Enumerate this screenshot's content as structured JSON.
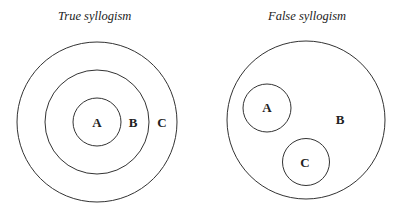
{
  "diagrams": [
    {
      "title": "True syllogism",
      "labels": {
        "a": "A",
        "b": "B",
        "c": "C"
      }
    },
    {
      "title": "False syllogism",
      "labels": {
        "a": "A",
        "b": "B",
        "c": "C"
      }
    }
  ]
}
